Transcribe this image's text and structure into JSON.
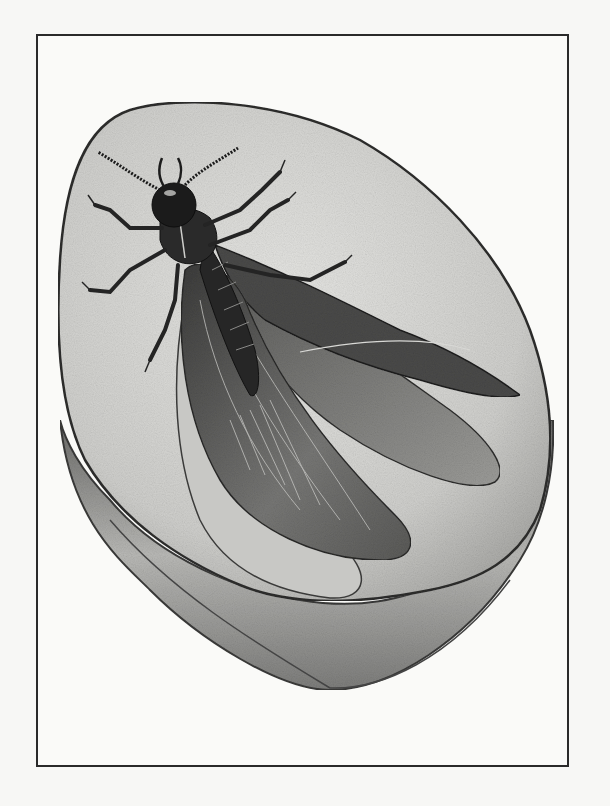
{
  "artwork": {
    "title": "Winged insect fossil in stone",
    "medium": "pencil illustration",
    "colors": {
      "paper": "#f7f7f5",
      "frame": "#2a2a2a",
      "stone_top": "#d6d6d3",
      "stone_side": "#8a8a88",
      "insect_dark": "#1e1e1e",
      "wing": "#6e6e6c"
    }
  }
}
